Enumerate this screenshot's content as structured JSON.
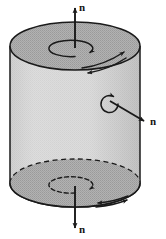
{
  "figure": {
    "type": "technical-line-diagram",
    "background_color": "#ffffff",
    "ink_color": "#1a1a1a",
    "surface_colors": {
      "top_cap_fill": "#a9a9a9",
      "bottom_cap_fill": "#a9a9a9",
      "lateral_surface_fill": "#d7d7d7",
      "outline": "#1a1a1a"
    },
    "labels": {
      "normal_top": "n",
      "normal_side": "n",
      "normal_bottom": "n"
    },
    "annotations": [
      {
        "name": "top-normal-arrow",
        "label": "n",
        "direction": "up",
        "attached_surface": "top-cap",
        "line_style": "solid"
      },
      {
        "name": "side-normal-arrow",
        "label": "n",
        "direction": "down-right",
        "attached_surface": "lateral-surface",
        "line_style": "solid"
      },
      {
        "name": "bottom-normal-arrow",
        "label": "n",
        "direction": "down",
        "attached_surface": "bottom-cap",
        "line_style": "solid"
      },
      {
        "name": "top-circulation-arrow",
        "label": "",
        "sense": "counterclockwise-from-above",
        "line_style": "solid"
      },
      {
        "name": "side-circulation-arrow",
        "label": "",
        "sense": "counterclockwise-about-side-normal",
        "line_style": "solid"
      },
      {
        "name": "bottom-circulation-arrow",
        "label": "",
        "sense": "clockwise-from-below",
        "line_style": "dashed"
      },
      {
        "name": "top-boundary-circulation-arrows",
        "label": "",
        "count": 2,
        "line_style": "solid"
      },
      {
        "name": "bottom-boundary-circulation-arrows",
        "label": "",
        "count": 2,
        "line_style": "solid"
      }
    ],
    "geometry": {
      "top_cap_center": [
        75,
        46
      ],
      "bottom_cap_center": [
        75,
        183
      ],
      "cap_radius_x": 65,
      "cap_radius_y": 24,
      "cylinder_left_x": 10,
      "cylinder_right_x": 140,
      "cylinder_top_y": 46,
      "cylinder_bottom_y": 183
    }
  }
}
